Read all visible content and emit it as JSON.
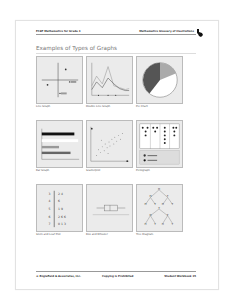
{
  "header": {
    "left": "FCAT Mathematics for Grade 3",
    "right": "Mathematics Glossary of Illustrations",
    "logo_icon": "florida-state-icon"
  },
  "title": "Examples of Types of Graphs",
  "graphs": [
    {
      "caption": "Line Graph",
      "icon": "coordinate-plane-graph"
    },
    {
      "caption": "Double Line Graph",
      "icon": "double-line-graph"
    },
    {
      "caption": "Pie Chart",
      "icon": "pie-chart"
    },
    {
      "caption": "Bar Graph",
      "icon": "bar-graph"
    },
    {
      "caption": "Scatterplot",
      "icon": "scatterplot"
    },
    {
      "caption": "Pictograph",
      "icon": "pictograph"
    },
    {
      "caption": "Stem and Leaf Plot",
      "icon": "stem-and-leaf-plot"
    },
    {
      "caption": "Box and Whisker",
      "icon": "box-and-whisker"
    },
    {
      "caption": "Tree Diagram",
      "icon": "tree-diagram"
    }
  ],
  "stem_leaf": {
    "stems": [
      "3",
      "4",
      "5",
      "6",
      "7"
    ],
    "leaves": [
      "2 4",
      "6",
      "1 9",
      "2 6 6",
      "0 1 3"
    ]
  },
  "pictograph": {
    "key": [
      "= 4 votes",
      "= 2 votes"
    ]
  },
  "tree": {
    "root": "H",
    "level1": [
      "H",
      "T"
    ],
    "level2": [
      "H",
      "T",
      "H",
      "T"
    ]
  },
  "line_graph_labels": [
    "A",
    "B",
    "C",
    "D"
  ],
  "footer": {
    "left": "© Englefield & Associates, Inc.",
    "middle": "Copying is Prohibited",
    "right": "Student Workbook 35"
  }
}
